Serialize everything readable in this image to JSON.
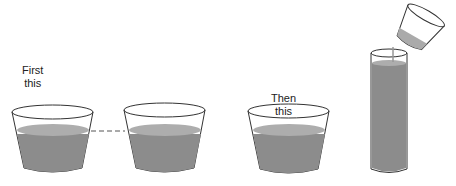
{
  "labels": {
    "first_line1": "First",
    "first_line2": "this",
    "then_line1": "Then",
    "then_line2": "this"
  },
  "colors": {
    "liquid": "#8c8c8c",
    "liquid_top": "#adadad",
    "outline": "#333333",
    "dashed_line": "#555555"
  }
}
